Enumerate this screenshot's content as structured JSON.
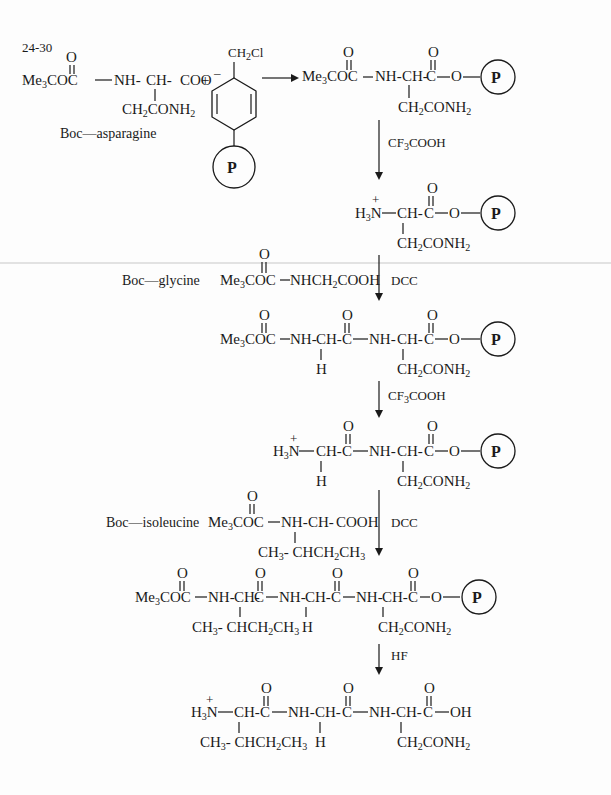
{
  "problem_number": "24-30",
  "resin_symbol": "P",
  "reagents": {
    "step1_reactant_label": "Boc—asparagine",
    "step1_reactant_formula": [
      "Me3COC",
      "NH",
      "CH",
      "COO⁻",
      "CH2CONH2"
    ],
    "benzyl_chloride_resin": "CH2Cl",
    "deprotect1": "CF3COOH",
    "boc_glycine_label": "Boc—glycine",
    "boc_glycine_formula": "Me3COC—NHCH2COOH",
    "coupling1": "DCC",
    "deprotect2": "CF3COOH",
    "boc_isoleucine_label": "Boc—isoleucine",
    "boc_isoleucine_formula": "Me3COC—NH-CH-COOH",
    "isoleucine_sidechain": "CH3-CHCH2CH3",
    "coupling2": "DCC",
    "cleavage": "HF"
  },
  "intermediates": [
    "Boc-Asn-O-resin",
    "H3N+-Asn-O-resin",
    "Boc-Gly-Asn-O-resin",
    "H3N+-Gly-Asn-O-resin",
    "Boc-Ile-Gly-Asn-O-resin"
  ],
  "product": "H3N+-Ile-Gly-Asn-OH",
  "text": {
    "plus": "+",
    "charge_plus": "+",
    "O": "O",
    "H": "H",
    "NH": "NH",
    "CH": "CH",
    "C": "C",
    "OH": "OH",
    "Me3COC": "Me3COC",
    "H3N": "H3N",
    "CH2CONH2": "CH2CONH2"
  }
}
